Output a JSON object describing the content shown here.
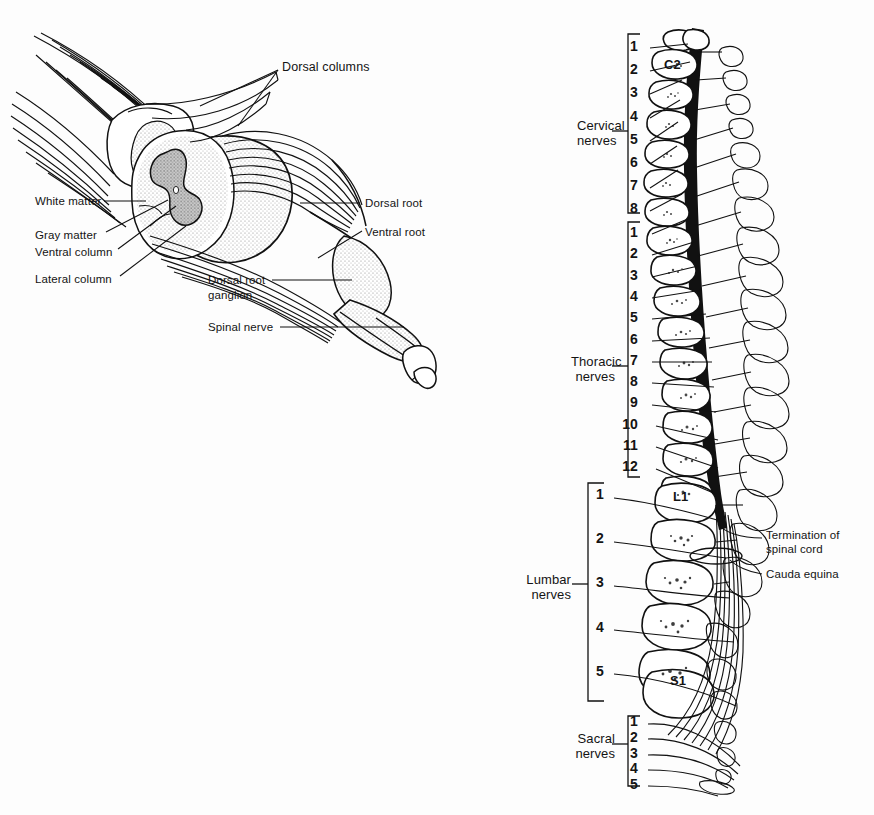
{
  "figure": {
    "background_color": "#fdfdfd",
    "ink_color": "#111111",
    "gray_matter_shade": "#b9b9b9",
    "stipple_shade": "#d8d8d8"
  },
  "left_panel": {
    "name": "spinal-cord-segment-detail",
    "labels": [
      {
        "id": "dorsal-columns",
        "text": "Dorsal columns",
        "x": 282,
        "y": 66,
        "size": "lbl-md",
        "align": "left"
      },
      {
        "id": "white-matter",
        "text": "White matter",
        "x": 35,
        "y": 201,
        "size": "lbl-sm",
        "align": "left"
      },
      {
        "id": "gray-matter",
        "text": "Gray matter",
        "x": 35,
        "y": 235,
        "size": "lbl-sm",
        "align": "left"
      },
      {
        "id": "ventral-column",
        "text": "Ventral column",
        "x": 35,
        "y": 252,
        "size": "lbl-sm",
        "align": "left"
      },
      {
        "id": "lateral-column",
        "text": "Lateral column",
        "x": 35,
        "y": 279,
        "size": "lbl-sm",
        "align": "left"
      },
      {
        "id": "dorsal-root",
        "text": "Dorsal root",
        "x": 365,
        "y": 206,
        "size": "lbl-sm",
        "align": "left"
      },
      {
        "id": "ventral-root",
        "text": "Ventral root",
        "x": 365,
        "y": 235,
        "size": "lbl-sm",
        "align": "left"
      },
      {
        "id": "dorsal-root-ganglion-line1",
        "text": "Dorsal root",
        "x": 208,
        "y": 283,
        "size": "lbl-sm",
        "align": "left"
      },
      {
        "id": "dorsal-root-ganglion-line2",
        "text": "ganglion",
        "x": 208,
        "y": 297,
        "size": "lbl-sm",
        "align": "left"
      },
      {
        "id": "spinal-nerve",
        "text": "Spinal nerve",
        "x": 208,
        "y": 330,
        "size": "lbl-sm",
        "align": "left"
      }
    ]
  },
  "right_panel": {
    "name": "vertebral-column-nerve-map",
    "groups": [
      {
        "id": "cervical",
        "label_line1": "Cervical",
        "label_line2": "nerves",
        "label_x": 577,
        "label_y": 120,
        "bracket_x": 628,
        "bracket_top": 34,
        "bracket_bottom": 213,
        "tick_x1": 612,
        "numbers": [
          "1",
          "2",
          "3",
          "4",
          "5",
          "6",
          "7",
          "8"
        ],
        "number_x": 634,
        "number_start_y": 48,
        "number_step": 23.2
      },
      {
        "id": "thoracic",
        "label_line1": "Thoracic",
        "label_line2": "nerves",
        "label_x": 574,
        "label_y": 360,
        "bracket_x": 628,
        "bracket_top": 222,
        "bracket_bottom": 477,
        "tick_x1": 612,
        "numbers": [
          "1",
          "2",
          "3",
          "4",
          "5",
          "6",
          "7",
          "8",
          "9",
          "10",
          "11",
          "12"
        ],
        "number_x": 634,
        "number_start_y": 234,
        "number_step": 21.3
      },
      {
        "id": "lumbar",
        "label_line1": "Lumbar",
        "label_line2": "nerves",
        "label_x": 538,
        "label_y": 578,
        "bracket_x": 588,
        "bracket_top": 483,
        "bracket_bottom": 701,
        "tick_x1": 572,
        "numbers": [
          "1",
          "2",
          "3",
          "4",
          "5"
        ],
        "number_x": 600,
        "number_start_y": 496,
        "number_step": 44.2
      },
      {
        "id": "sacral",
        "label_line1": "Sacral",
        "label_line2": "nerves",
        "label_x": 577,
        "label_y": 734,
        "bracket_x": 628,
        "bracket_top": 716,
        "bracket_bottom": 786,
        "tick_x1": 612,
        "numbers": [
          "1",
          "2",
          "3",
          "4",
          "5"
        ],
        "number_x": 634,
        "number_start_y": 723,
        "number_step": 15.8
      }
    ],
    "vertebra_labels": [
      {
        "id": "C2",
        "text": "C2",
        "x": 664,
        "y": 66
      },
      {
        "id": "L1",
        "text": "L1",
        "x": 673,
        "y": 498
      },
      {
        "id": "S1",
        "text": "S1",
        "x": 670,
        "y": 682
      }
    ],
    "side_labels": [
      {
        "id": "termination-of-spinal-cord-line1",
        "text": "Termination of",
        "x": 766,
        "y": 536
      },
      {
        "id": "termination-of-spinal-cord-line2",
        "text": "spinal cord",
        "x": 766,
        "y": 550
      },
      {
        "id": "cauda-equina",
        "text": "Cauda equina",
        "x": 766,
        "y": 575
      }
    ]
  }
}
